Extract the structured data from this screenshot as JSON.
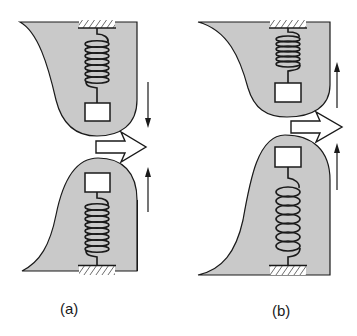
{
  "colors": {
    "shape_fill": "#c9c9c9",
    "stroke": "#1a1a1a",
    "background": "#ffffff",
    "mass_fill": "#ffffff"
  },
  "panels": [
    {
      "id": "a",
      "label": "(a)",
      "description": "Upper and lower spring-mass systems; upper moves down, lower moves up (opposite directions), flow arrow between them",
      "top_motion": "down",
      "bottom_motion": "up"
    },
    {
      "id": "b",
      "label": "(b)",
      "description": "Upper and lower spring-mass systems; both move up (same direction), flow arrow between them",
      "top_motion": "up",
      "bottom_motion": "up"
    }
  ]
}
